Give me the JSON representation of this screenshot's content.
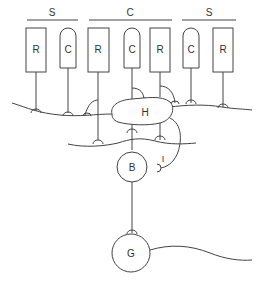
{
  "diagram": {
    "groups": [
      {
        "label": "S",
        "x1": 27,
        "x2": 78,
        "label_x": 52
      },
      {
        "label": "C",
        "x1": 89,
        "x2": 172,
        "label_x": 130
      },
      {
        "label": "S",
        "x1": 182,
        "x2": 236,
        "label_x": 209
      }
    ],
    "photoreceptors": [
      {
        "type": "rod",
        "label": "R",
        "x": 36
      },
      {
        "type": "cone",
        "label": "C",
        "x": 68
      },
      {
        "type": "rod",
        "label": "R",
        "x": 98
      },
      {
        "type": "cone",
        "label": "C",
        "x": 132
      },
      {
        "type": "rod",
        "label": "R",
        "x": 160
      },
      {
        "type": "cone",
        "label": "C",
        "x": 191
      },
      {
        "type": "rod",
        "label": "R",
        "x": 223
      }
    ],
    "cells": {
      "horizontal": {
        "label": "H"
      },
      "bipolar": {
        "label": "B"
      },
      "interplexiform": {
        "label": "I"
      },
      "ganglion": {
        "label": "G"
      }
    },
    "colors": {
      "stroke": "#444444",
      "text": "#333333",
      "background": "#ffffff"
    }
  }
}
